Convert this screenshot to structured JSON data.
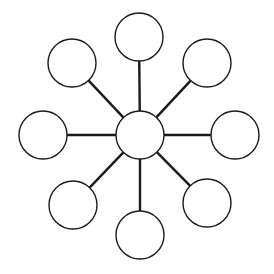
{
  "diagram": {
    "type": "hub-and-spoke",
    "background": "#ffffff",
    "stroke_color": "#1a1a1a",
    "node_fill": "#ffffff",
    "node_radius": 24,
    "center_node": {
      "id": "center",
      "cx": 140,
      "cy": 135,
      "label": ""
    },
    "outer_nodes": [
      {
        "id": "top",
        "cx": 139,
        "cy": 37,
        "label": ""
      },
      {
        "id": "top-right",
        "cx": 207,
        "cy": 63,
        "label": ""
      },
      {
        "id": "right",
        "cx": 235,
        "cy": 135,
        "label": ""
      },
      {
        "id": "bottom-right",
        "cx": 207,
        "cy": 203,
        "label": ""
      },
      {
        "id": "bottom",
        "cx": 140,
        "cy": 235,
        "label": ""
      },
      {
        "id": "bottom-left",
        "cx": 73,
        "cy": 205,
        "label": ""
      },
      {
        "id": "left",
        "cx": 43,
        "cy": 135,
        "label": ""
      },
      {
        "id": "top-left",
        "cx": 72,
        "cy": 63,
        "label": ""
      }
    ]
  }
}
